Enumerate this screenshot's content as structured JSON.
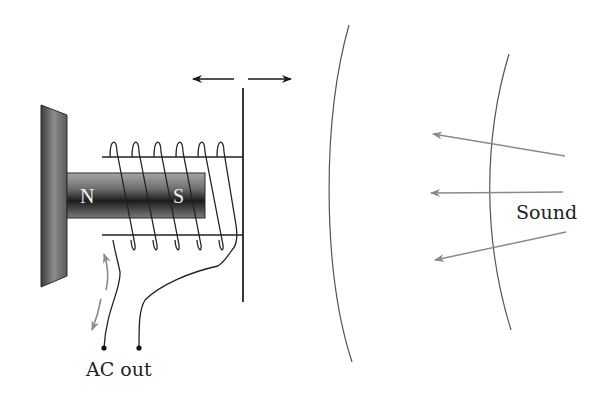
{
  "diagram": {
    "labels": {
      "magnet_north": "N",
      "magnet_south": "S",
      "output": "AC out",
      "sound": "Sound"
    },
    "colors": {
      "line": "#222222",
      "arrow_gray": "#8a8a8a",
      "wavefront": "#555555",
      "plate_dark": "#3a3a3a",
      "plate_light": "#b0b0b0",
      "magnet_dark": "#1e1e1e",
      "magnet_light": "#9a9a9a"
    },
    "components": [
      {
        "name": "base-plate",
        "description": "Fixed mounting plate (gray gradient)"
      },
      {
        "name": "bar-magnet",
        "description": "Horizontal permanent magnet with N and S poles"
      },
      {
        "name": "coil",
        "description": "Wire coil wound around magnet, attached to diaphragm",
        "turns": 6
      },
      {
        "name": "diaphragm",
        "description": "Vertical diaphragm that vibrates left/right"
      },
      {
        "name": "vibration-arrows",
        "description": "Double-headed horizontal arrow above diaphragm"
      },
      {
        "name": "current-arrows",
        "description": "Gray curved arrows indicating alternating current"
      },
      {
        "name": "output-terminals",
        "description": "Two terminal dots labeled AC out"
      },
      {
        "name": "wavefronts",
        "description": "Two curved sound wavefronts",
        "count": 2
      },
      {
        "name": "sound-arrows",
        "description": "Three gray arrows pointing toward microphone",
        "count": 3
      }
    ]
  }
}
